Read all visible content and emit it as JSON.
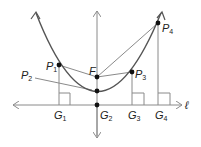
{
  "diagram": {
    "type": "parabola-focus-directrix",
    "colors": {
      "curve": "#555555",
      "lines": "#8a8a8a",
      "points": "#111111",
      "text": "#222222"
    },
    "directrix": {
      "label": "ℓ"
    },
    "focus": {
      "label": "F"
    },
    "points": [
      {
        "label": "P",
        "sub": "1"
      },
      {
        "label": "P",
        "sub": "2"
      },
      {
        "label": "P",
        "sub": "3"
      },
      {
        "label": "P",
        "sub": "4"
      }
    ],
    "feet": [
      {
        "label": "G",
        "sub": "1"
      },
      {
        "label": "G",
        "sub": "2"
      },
      {
        "label": "G",
        "sub": "3"
      },
      {
        "label": "G",
        "sub": "4"
      }
    ]
  }
}
